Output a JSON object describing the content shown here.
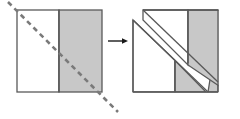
{
  "figure": {
    "title": "Dissection of a square along a diagonal",
    "background_color": "#ffffff",
    "outline_color": "#595959",
    "fill_gray": "#c8c8c8",
    "fill_white": "#ffffff",
    "dash_color": "#7a7a7a",
    "arrow_color": "#1a1a1a",
    "canvas": {
      "width": 240,
      "height": 119
    }
  },
  "left_panel": {
    "label": "original-square",
    "square": {
      "x": 17,
      "y": 10,
      "width": 85,
      "height": 82
    },
    "divider_x": 59,
    "regions": [
      {
        "name": "left-white-rectangle",
        "fill": "#ffffff"
      },
      {
        "name": "right-gray-rectangle",
        "fill": "#c8c8c8"
      }
    ],
    "cut_line": {
      "name": "dashed-diagonal-cut-line",
      "style": "dashed",
      "from": {
        "x": 8,
        "y": 2
      },
      "to": {
        "x": 118,
        "y": 112
      },
      "dash_pattern": "5 4",
      "stroke_width": 2.6,
      "color": "#7a7a7a"
    }
  },
  "arrow": {
    "name": "transformation-arrow",
    "from": {
      "x": 108,
      "y": 41
    },
    "to": {
      "x": 128,
      "y": 41
    },
    "color": "#1a1a1a"
  },
  "right_panel": {
    "label": "dissected-square",
    "square": {
      "x": 133,
      "y": 10,
      "width": 85,
      "height": 82
    },
    "shift": {
      "dx": 10,
      "dy": 10
    },
    "regions": [
      {
        "name": "upper-left-white-triangle",
        "fill": "#ffffff"
      },
      {
        "name": "slid-white-rectangle-piece",
        "fill": "#ffffff"
      },
      {
        "name": "upper-right-gray-rectangle",
        "fill": "#c8c8c8"
      },
      {
        "name": "lower-gray-triangle-piece",
        "fill": "#c8c8c8"
      },
      {
        "name": "lower-right-gray-triangle",
        "fill": "#c8c8c8"
      }
    ],
    "divider_x": 175
  }
}
